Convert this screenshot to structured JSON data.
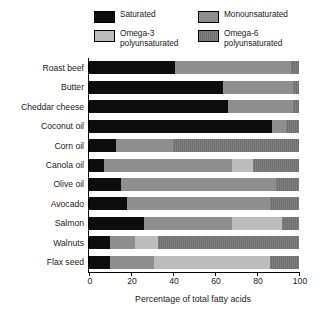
{
  "legend": {
    "items": [
      {
        "label": "Saturated",
        "key": "sat",
        "color": "#0d0d0d"
      },
      {
        "label": "Monounsaturated",
        "key": "mono",
        "color": "#8e8e8e"
      },
      {
        "label": "Omega-3\npolyunsaturated",
        "key": "o3",
        "color": "#bcbcbc"
      },
      {
        "label": "Omega-6\npolyunsaturated",
        "key": "o6",
        "color": "#6e6e6e"
      }
    ]
  },
  "chart_data": {
    "type": "bar",
    "orientation": "horizontal",
    "stacked": true,
    "title": "",
    "xlabel": "Percentage of total fatty acids",
    "ylabel": "",
    "xlim": [
      0,
      100
    ],
    "xticks": [
      0,
      20,
      40,
      60,
      80,
      100
    ],
    "xtick_labels": [
      "0",
      "20",
      "40",
      "60",
      "80",
      "100"
    ],
    "grid": false,
    "legend_position": "top",
    "categories": [
      "Roast beef",
      "Butter",
      "Cheddar cheese",
      "Coconut oil",
      "Corn oil",
      "Canola oil",
      "Olive oil",
      "Avocado",
      "Salmon",
      "Walnuts",
      "Flax seed"
    ],
    "series": [
      {
        "name": "Saturated",
        "color": "#0d0d0d",
        "values": [
          41,
          64,
          66,
          87,
          13,
          7,
          15,
          18,
          26,
          10,
          10
        ]
      },
      {
        "name": "Monounsaturated",
        "color": "#8e8e8e",
        "values": [
          55,
          33,
          31,
          7,
          27,
          61,
          74,
          68,
          42,
          12,
          21
        ]
      },
      {
        "name": "Omega-3 polyunsaturated",
        "color": "#bcbcbc",
        "values": [
          0,
          0,
          0,
          0,
          0,
          10,
          0,
          0,
          24,
          11,
          55
        ]
      },
      {
        "name": "Omega-6 polyunsaturated",
        "color": "#6e6e6e",
        "values": [
          4,
          3,
          3,
          6,
          60,
          22,
          11,
          14,
          8,
          67,
          14
        ]
      }
    ]
  }
}
